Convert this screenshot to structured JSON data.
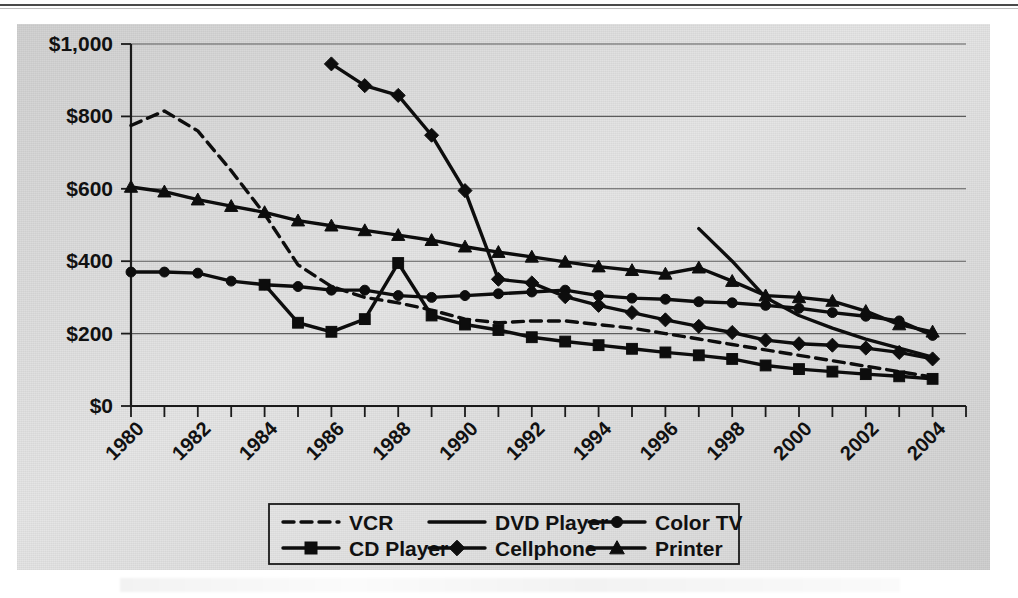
{
  "chart_data": {
    "type": "line",
    "title": "",
    "xlabel": "",
    "ylabel": "",
    "xlim": [
      1980,
      2005
    ],
    "ylim": [
      0,
      1000
    ],
    "grid": true,
    "legend_position": "bottom",
    "y_ticks": [
      0,
      200,
      400,
      600,
      800,
      1000
    ],
    "y_tick_labels": [
      "$0",
      "$200",
      "$400",
      "$600",
      "$800",
      "$1,000"
    ],
    "x_tick_labels": [
      "1980",
      "1982",
      "1984",
      "1986",
      "1988",
      "1990",
      "1992",
      "1994",
      "1996",
      "1998",
      "2000",
      "2002",
      "2004"
    ],
    "x_tick_values": [
      1980,
      1982,
      1984,
      1986,
      1988,
      1990,
      1992,
      1994,
      1996,
      1998,
      2000,
      2002,
      2004
    ],
    "x_minor_ticks": [
      1980,
      1981,
      1982,
      1983,
      1984,
      1985,
      1986,
      1987,
      1988,
      1989,
      1990,
      1991,
      1992,
      1993,
      1994,
      1995,
      1996,
      1997,
      1998,
      1999,
      2000,
      2001,
      2002,
      2003,
      2004,
      2005
    ],
    "series": [
      {
        "name": "VCR",
        "marker": "none",
        "dash": true,
        "x": [
          1980,
          1981,
          1982,
          1983,
          1984,
          1985,
          1986,
          1987,
          1988,
          1989,
          1990,
          1991,
          1992,
          1993,
          1994,
          1995,
          1996,
          1997,
          1998,
          1999,
          2000,
          2001,
          2002,
          2003,
          2004
        ],
        "values": [
          775,
          815,
          760,
          650,
          530,
          390,
          330,
          300,
          285,
          265,
          240,
          230,
          235,
          235,
          225,
          215,
          200,
          185,
          170,
          155,
          140,
          125,
          110,
          95,
          80
        ]
      },
      {
        "name": "DVD Player",
        "marker": "none",
        "dash": false,
        "x": [
          1997,
          1998,
          1999,
          2000,
          2001,
          2002,
          2003,
          2004
        ],
        "values": [
          490,
          400,
          300,
          250,
          215,
          185,
          160,
          135
        ]
      },
      {
        "name": "Color TV",
        "marker": "circle",
        "dash": false,
        "x": [
          1980,
          1981,
          1982,
          1983,
          1984,
          1985,
          1986,
          1987,
          1988,
          1989,
          1990,
          1991,
          1992,
          1993,
          1994,
          1995,
          1996,
          1997,
          1998,
          1999,
          2000,
          2001,
          2002,
          2003,
          2004
        ],
        "values": [
          370,
          370,
          367,
          345,
          335,
          330,
          320,
          320,
          305,
          300,
          305,
          310,
          315,
          320,
          305,
          298,
          295,
          288,
          285,
          278,
          270,
          258,
          248,
          235,
          195
        ]
      },
      {
        "name": "CD Player",
        "marker": "square",
        "dash": false,
        "x": [
          1984,
          1985,
          1986,
          1987,
          1988,
          1989,
          1990,
          1991,
          1992,
          1993,
          1994,
          1995,
          1996,
          1997,
          1998,
          1999,
          2000,
          2001,
          2002,
          2003,
          2004
        ],
        "values": [
          335,
          230,
          205,
          240,
          395,
          250,
          225,
          210,
          190,
          178,
          168,
          158,
          148,
          140,
          130,
          112,
          102,
          95,
          88,
          82,
          75
        ]
      },
      {
        "name": "Cellphone",
        "marker": "diamond",
        "dash": false,
        "x": [
          1986,
          1987,
          1988,
          1989,
          1990,
          1991,
          1992,
          1993,
          1994,
          1995,
          1996,
          1997,
          1998,
          1999,
          2000,
          2001,
          2002,
          2003,
          2004
        ],
        "values": [
          945,
          885,
          858,
          748,
          595,
          350,
          340,
          302,
          278,
          258,
          238,
          220,
          203,
          182,
          172,
          168,
          160,
          148,
          130
        ]
      },
      {
        "name": "Printer",
        "marker": "triangle",
        "dash": false,
        "x": [
          1980,
          1981,
          1982,
          1983,
          1984,
          1985,
          1986,
          1987,
          1988,
          1989,
          1990,
          1991,
          1992,
          1993,
          1994,
          1995,
          1996,
          1997,
          1998,
          1999,
          2000,
          2001,
          2002,
          2003,
          2004
        ],
        "values": [
          605,
          592,
          570,
          552,
          535,
          512,
          498,
          485,
          472,
          458,
          440,
          425,
          412,
          398,
          385,
          375,
          365,
          382,
          345,
          305,
          300,
          290,
          262,
          225,
          205
        ]
      }
    ]
  },
  "legend": {
    "items": [
      {
        "label": "VCR"
      },
      {
        "label": "DVD Player"
      },
      {
        "label": "Color TV"
      },
      {
        "label": "CD Player"
      },
      {
        "label": "Cellphone"
      },
      {
        "label": "Printer"
      }
    ]
  },
  "colors": {
    "ink": "#0d0d0d",
    "grid": "#5c5c5c",
    "panel": "#d5d5d5",
    "page": "#ffffff"
  }
}
